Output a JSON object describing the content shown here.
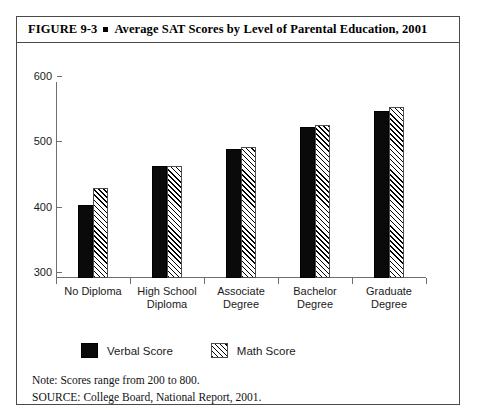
{
  "figure": {
    "number": "FIGURE  9-3",
    "bullet_icon": "square-bullet-icon",
    "title": "Average SAT Scores by Level of Parental Education, 2001"
  },
  "notes": {
    "note": "Note: Scores range from 200 to 800.",
    "source": "SOURCE: College Board, National Report, 2001."
  },
  "chart_data": {
    "type": "bar",
    "title": "Average SAT Scores by Level of Parental Education, 2001",
    "xlabel": "",
    "ylabel": "",
    "ylim": [
      300,
      600
    ],
    "yticks": [
      300,
      400,
      500,
      600
    ],
    "grid": false,
    "legend_position": "bottom-left",
    "categories": [
      "No Diploma",
      "High School Diploma",
      "Associate Degree",
      "Bachelor Degree",
      "Graduate Degree"
    ],
    "category_lines": [
      [
        "No Diploma"
      ],
      [
        "High School",
        "Diploma"
      ],
      [
        "Associate",
        "Degree"
      ],
      [
        "Bachelor",
        "Degree"
      ],
      [
        "Graduate",
        "Degree"
      ]
    ],
    "series": [
      {
        "name": "Verbal Score",
        "fill": "solid-black",
        "color": "#0a0a0a",
        "values": [
          412,
          472,
          497,
          531,
          556
        ]
      },
      {
        "name": "Math Score",
        "fill": "diagonal-hatch",
        "color": "#ffffff",
        "values": [
          438,
          472,
          500,
          534,
          561
        ]
      }
    ]
  }
}
